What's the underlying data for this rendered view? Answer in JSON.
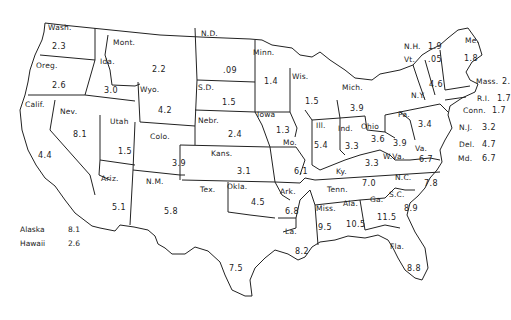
{
  "map": {
    "type": "choropleth-labels",
    "region": "United States",
    "states": [
      {
        "abbr": "Wash.",
        "value": "2.3",
        "lx": 48,
        "ly": 24,
        "vx": 52,
        "vy": 43
      },
      {
        "abbr": "Oreg.",
        "value": "2.6",
        "lx": 36,
        "ly": 62,
        "vx": 52,
        "vy": 82
      },
      {
        "abbr": "Calif.",
        "value": "4.4",
        "lx": 25,
        "ly": 101,
        "vx": 38,
        "vy": 152
      },
      {
        "abbr": "Ida.",
        "value": "3.0",
        "lx": 100,
        "ly": 58,
        "vx": 104,
        "vy": 87
      },
      {
        "abbr": "Nev.",
        "value": "8.1",
        "lx": 60,
        "ly": 108,
        "vx": 73,
        "vy": 131
      },
      {
        "abbr": "Mont.",
        "value": "2.2",
        "lx": 113,
        "ly": 39,
        "vx": 152,
        "vy": 66
      },
      {
        "abbr": "Wyo.",
        "value": "4.2",
        "lx": 140,
        "ly": 86,
        "vx": 158,
        "vy": 107
      },
      {
        "abbr": "Utah",
        "value": "1.5",
        "lx": 110,
        "ly": 118,
        "vx": 118,
        "vy": 148
      },
      {
        "abbr": "Colo.",
        "value": "3.9",
        "lx": 150,
        "ly": 133,
        "vx": 172,
        "vy": 160
      },
      {
        "abbr": "Ariz.",
        "value": "5.1",
        "lx": 101,
        "ly": 175,
        "vx": 112,
        "vy": 204
      },
      {
        "abbr": "N.M.",
        "value": "5.8",
        "lx": 146,
        "ly": 178,
        "vx": 164,
        "vy": 208
      },
      {
        "abbr": "N.D.",
        "value": ".09",
        "lx": 201,
        "ly": 30,
        "vx": 223,
        "vy": 67
      },
      {
        "abbr": "S.D.",
        "value": "1.5",
        "lx": 198,
        "ly": 84,
        "vx": 222,
        "vy": 99
      },
      {
        "abbr": "Nebr.",
        "value": "2.4",
        "lx": 198,
        "ly": 117,
        "vx": 228,
        "vy": 131
      },
      {
        "abbr": "Kans.",
        "value": "3.1",
        "lx": 211,
        "ly": 150,
        "vx": 237,
        "vy": 168
      },
      {
        "abbr": "Okla.",
        "value": "4.5",
        "lx": 227,
        "ly": 183,
        "vx": 251,
        "vy": 199
      },
      {
        "abbr": "Tex.",
        "value": "7.5",
        "lx": 200,
        "ly": 186,
        "vx": 229,
        "vy": 265
      },
      {
        "abbr": "Minn.",
        "value": "1.4",
        "lx": 253,
        "ly": 49,
        "vx": 264,
        "vy": 78
      },
      {
        "abbr": "Iowa",
        "value": "1.3",
        "lx": 257,
        "ly": 111,
        "vx": 276,
        "vy": 127
      },
      {
        "abbr": "Mo.",
        "value": "6.1",
        "lx": 283,
        "ly": 139,
        "vx": 294,
        "vy": 168
      },
      {
        "abbr": "Ark.",
        "value": "6.8",
        "lx": 280,
        "ly": 188,
        "vx": 285,
        "vy": 208
      },
      {
        "abbr": "La.",
        "value": "8.2",
        "lx": 285,
        "ly": 228,
        "vx": 295,
        "vy": 248
      },
      {
        "abbr": "Wis.",
        "value": "1.5",
        "lx": 292,
        "ly": 73,
        "vx": 305,
        "vy": 98
      },
      {
        "abbr": "Ill.",
        "value": "5.4",
        "lx": 316,
        "ly": 122,
        "vx": 314,
        "vy": 142
      },
      {
        "abbr": "Mich.",
        "value": "3.9",
        "lx": 342,
        "ly": 84,
        "vx": 350,
        "vy": 105
      },
      {
        "abbr": "Ind.",
        "value": "3.3",
        "lx": 338,
        "ly": 125,
        "vx": 345,
        "vy": 143
      },
      {
        "abbr": "Ohio",
        "value": "3.6",
        "lx": 361,
        "ly": 123,
        "vx": 371,
        "vy": 136
      },
      {
        "abbr": "Ky.",
        "value": "3.3",
        "lx": 336,
        "ly": 168,
        "vx": 365,
        "vy": 160
      },
      {
        "abbr": "Tenn.",
        "value": "7.0",
        "lx": 327,
        "ly": 186,
        "vx": 362,
        "vy": 180
      },
      {
        "abbr": "Miss.",
        "value": "9.5",
        "lx": 316,
        "ly": 205,
        "vx": 318,
        "vy": 224
      },
      {
        "abbr": "Ala.",
        "value": "10.5",
        "lx": 343,
        "ly": 200,
        "vx": 346,
        "vy": 221
      },
      {
        "abbr": "Ga.",
        "value": "11.5",
        "lx": 370,
        "ly": 196,
        "vx": 377,
        "vy": 214
      },
      {
        "abbr": "Fla.",
        "value": "8.8",
        "lx": 390,
        "ly": 243,
        "vx": 407,
        "vy": 265
      },
      {
        "abbr": "S.C.",
        "value": "8.9",
        "lx": 389,
        "ly": 191,
        "vx": 404,
        "vy": 205
      },
      {
        "abbr": "N.C.",
        "value": "7.8",
        "lx": 395,
        "ly": 174,
        "vx": 424,
        "vy": 180
      },
      {
        "abbr": "Va.",
        "value": "6.7",
        "lx": 415,
        "ly": 145,
        "vx": 419,
        "vy": 156
      },
      {
        "abbr": "W.Va.",
        "value": "3.9",
        "lx": 383,
        "ly": 153,
        "vx": 393,
        "vy": 140
      },
      {
        "abbr": "Pa.",
        "value": "3.4",
        "lx": 398,
        "ly": 111,
        "vx": 418,
        "vy": 121
      },
      {
        "abbr": "N.Y.",
        "value": "4.6",
        "lx": 411,
        "ly": 92,
        "vx": 429,
        "vy": 81
      },
      {
        "abbr": "Me.",
        "value": "1.8",
        "lx": 465,
        "ly": 37,
        "vx": 464,
        "vy": 55
      },
      {
        "abbr": "N.H.",
        "value": "1.9",
        "lx": 404,
        "ly": 43,
        "vx": 428,
        "vy": 43
      },
      {
        "abbr": "Vt.",
        "value": ".05",
        "lx": 404,
        "ly": 56,
        "vx": 428,
        "vy": 56
      },
      {
        "abbr": "Mass.",
        "value": "2.",
        "lx": 476,
        "ly": 78,
        "vx": 502,
        "vy": 78
      },
      {
        "abbr": "R.I.",
        "value": "1.7",
        "lx": 477,
        "ly": 95,
        "vx": 497,
        "vy": 95
      },
      {
        "abbr": "Conn.",
        "value": "1.7",
        "lx": 463,
        "ly": 107,
        "vx": 492,
        "vy": 107
      },
      {
        "abbr": "N.J.",
        "value": "3.2",
        "lx": 459,
        "ly": 124,
        "vx": 482,
        "vy": 124
      },
      {
        "abbr": "Del.",
        "value": "4.7",
        "lx": 459,
        "ly": 141,
        "vx": 482,
        "vy": 141
      },
      {
        "abbr": "Md.",
        "value": "6.7",
        "lx": 458,
        "ly": 155,
        "vx": 482,
        "vy": 155
      }
    ],
    "legend": [
      {
        "name": "Alaska",
        "value": "8.1"
      },
      {
        "name": "Hawaii",
        "value": "2.6"
      }
    ]
  }
}
